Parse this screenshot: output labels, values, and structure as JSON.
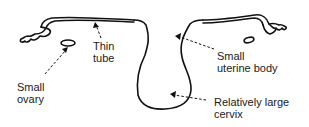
{
  "diagram": {
    "stroke_color": "#111111",
    "labels": [
      {
        "id": "thin-tube",
        "lines": [
          "Thin",
          "tube"
        ]
      },
      {
        "id": "small-ovary",
        "lines": [
          "Small",
          "ovary"
        ]
      },
      {
        "id": "small-uterine-body",
        "lines": [
          "Small",
          "uterine body"
        ]
      },
      {
        "id": "large-cervix",
        "lines": [
          "Relatively large",
          "cervix"
        ]
      }
    ]
  }
}
